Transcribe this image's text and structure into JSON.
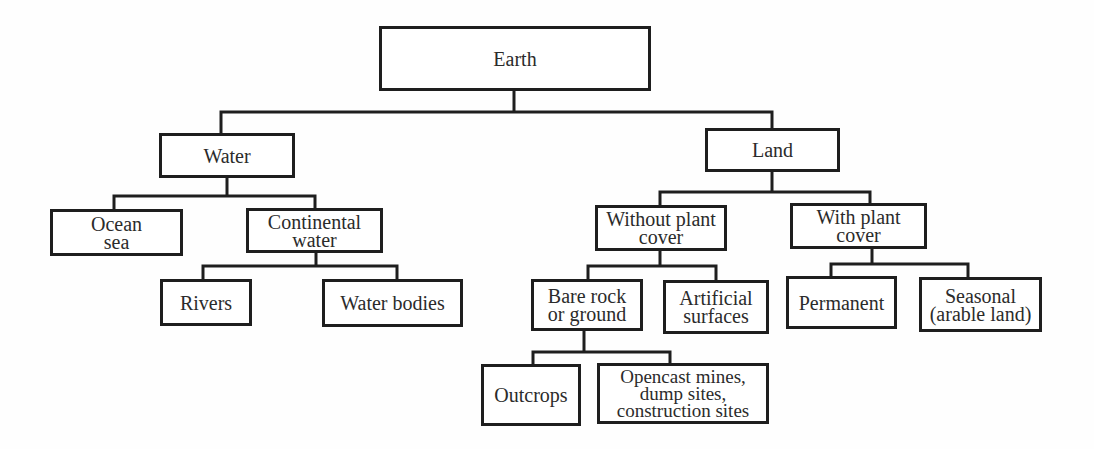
{
  "diagram": {
    "type": "tree",
    "root": "earth",
    "nodes": {
      "earth": {
        "label": "Earth"
      },
      "water": {
        "label": "Water"
      },
      "land": {
        "label": "Land"
      },
      "ocean_sea": {
        "label": "Ocean\nsea"
      },
      "continental_water": {
        "label": "Continental\nwater"
      },
      "rivers": {
        "label": "Rivers"
      },
      "water_bodies": {
        "label": "Water bodies"
      },
      "without_plant_cover": {
        "label": "Without plant\ncover"
      },
      "with_plant_cover": {
        "label": "With plant\ncover"
      },
      "bare_rock_or_ground": {
        "label": "Bare rock\nor ground"
      },
      "artificial_surfaces": {
        "label": "Artificial\nsurfaces"
      },
      "permanent": {
        "label": "Permanent"
      },
      "seasonal": {
        "label": "Seasonal\n(arable land)"
      },
      "outcrops": {
        "label": "Outcrops"
      },
      "opencast_mines": {
        "label": "Opencast mines,\ndump sites,\nconstruction sites"
      }
    },
    "edges": [
      [
        "earth",
        "water"
      ],
      [
        "earth",
        "land"
      ],
      [
        "water",
        "ocean_sea"
      ],
      [
        "water",
        "continental_water"
      ],
      [
        "continental_water",
        "rivers"
      ],
      [
        "continental_water",
        "water_bodies"
      ],
      [
        "land",
        "without_plant_cover"
      ],
      [
        "land",
        "with_plant_cover"
      ],
      [
        "without_plant_cover",
        "bare_rock_or_ground"
      ],
      [
        "without_plant_cover",
        "artificial_surfaces"
      ],
      [
        "with_plant_cover",
        "permanent"
      ],
      [
        "with_plant_cover",
        "seasonal"
      ],
      [
        "bare_rock_or_ground",
        "outcrops"
      ],
      [
        "bare_rock_or_ground",
        "opencast_mines"
      ]
    ],
    "colors": {
      "line": "#1e1e1e",
      "text": "#2b2b2b",
      "background": "#fefefe"
    }
  }
}
